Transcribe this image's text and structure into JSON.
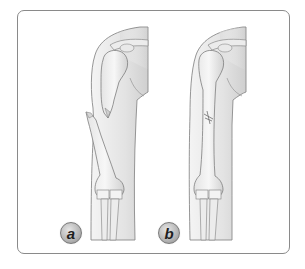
{
  "figure": {
    "panels": [
      {
        "id": "a",
        "label": "a",
        "description": "Displaced fracture of humeral shaft"
      },
      {
        "id": "b",
        "label": "b",
        "description": "Non-displaced (aligned) fracture of humeral shaft"
      }
    ]
  },
  "colors": {
    "frame_border": "#8a8a8a",
    "bone_fill": "#f2f2f2",
    "outline": "#7d7d7d",
    "shadow": "#d4d4d4",
    "badge_fill": "#b9b9b9"
  }
}
